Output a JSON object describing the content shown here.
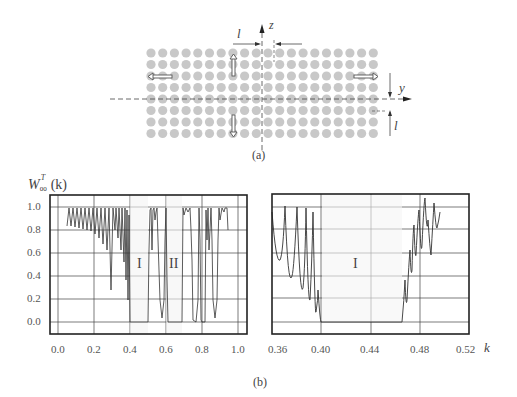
{
  "figure_a": {
    "caption": "(a)",
    "grid": {
      "columns": 20,
      "rows": 8,
      "x0": 151,
      "dx": 11.7,
      "y0": 53,
      "dy": 11.5,
      "dot_color": "#c8c8c8"
    },
    "axis_z_label": "z",
    "axis_y_label": "y",
    "spacing_label_top": "l",
    "spacing_label_right": "l"
  },
  "figure_b": {
    "caption": "(b)",
    "ylabel_main": "W",
    "ylabel_sup": "T",
    "ylabel_sub": "00",
    "ylabel_arg": "(k)",
    "xlabel": "k",
    "left_plot": {
      "xticks": [
        "0.0",
        "0.2",
        "0.4",
        "0.6",
        "0.8",
        "1.0"
      ],
      "yticks": [
        "1.0",
        "0.8",
        "0.6",
        "0.4",
        "0.2",
        "0.0"
      ],
      "region_labels": [
        "I",
        "II"
      ]
    },
    "right_plot": {
      "xticks": [
        "0.36",
        "0.40",
        "0.44",
        "0.48",
        "0.52"
      ],
      "region_labels": [
        "I"
      ]
    }
  },
  "chart_data": [
    {
      "type": "line",
      "title": "",
      "xlabel": "k",
      "ylabel": "W_00^T(k)",
      "xlim": [
        -0.02,
        1.02
      ],
      "ylim": [
        -0.1,
        1.1
      ],
      "grid": true,
      "annotations": [
        {
          "text": "I",
          "x": 0.45,
          "y": 0.5
        },
        {
          "text": "II",
          "x": 0.64,
          "y": 0.5
        }
      ],
      "band_gaps": [
        [
          0.4,
          0.5
        ],
        [
          0.6,
          0.69
        ],
        [
          0.8,
          0.82
        ]
      ],
      "series": [
        {
          "name": "transmission",
          "x": [
            0.05,
            0.1,
            0.15,
            0.2,
            0.25,
            0.28,
            0.3,
            0.35,
            0.38,
            0.4,
            0.5,
            0.52,
            0.56,
            0.58,
            0.6,
            0.69,
            0.72,
            0.76,
            0.8,
            0.82,
            0.85,
            0.87,
            0.9,
            0.93
          ],
          "y": [
            0.85,
            0.95,
            0.88,
            0.8,
            0.7,
            0.3,
            0.95,
            0.6,
            0.2,
            0.0,
            0.0,
            0.95,
            0.4,
            0.05,
            0.0,
            0.0,
            0.95,
            0.8,
            0.0,
            0.0,
            0.85,
            0.05,
            0.95,
            0.8
          ]
        }
      ]
    },
    {
      "type": "line",
      "title": "",
      "xlabel": "k",
      "ylabel": "W_00^T(k)",
      "xlim": [
        0.355,
        0.52
      ],
      "ylim": [
        -0.1,
        1.1
      ],
      "grid": true,
      "annotations": [
        {
          "text": "I",
          "x": 0.43,
          "y": 0.5
        }
      ],
      "band_gaps": [
        [
          0.395,
          0.505
        ]
      ],
      "series": [
        {
          "name": "transmission",
          "x": [
            0.355,
            0.36,
            0.365,
            0.37,
            0.375,
            0.38,
            0.385,
            0.39,
            0.393,
            0.395,
            0.505,
            0.508,
            0.511,
            0.514,
            0.517,
            0.52
          ],
          "y": [
            1.0,
            0.55,
            1.0,
            0.35,
            1.0,
            0.2,
            0.9,
            0.12,
            0.02,
            0.0,
            0.0,
            0.35,
            0.7,
            0.9,
            0.6,
            0.95
          ]
        }
      ]
    }
  ]
}
